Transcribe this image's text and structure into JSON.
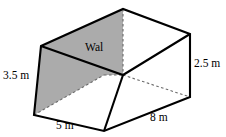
{
  "figure": {
    "type": "3d-cuboid-room-with-interior-wall",
    "caption_labels": {
      "wall_label": "Wal"
    },
    "colors": {
      "wall_fill": "#ababab",
      "wall_top_fill": "#ababab",
      "stroke": "#000000",
      "background": "#ffffff",
      "hidden_edge": "#6b6b6b"
    },
    "dimensions": [
      {
        "id": "height",
        "value": "3.5 m",
        "number": 3.5,
        "unit": "m",
        "edge": "left-vertical-front-left-height"
      },
      {
        "id": "depth",
        "value": "5 m",
        "number": 5,
        "unit": "m",
        "edge": "bottom-front-left-depth"
      },
      {
        "id": "width",
        "value": "8 m",
        "number": 8,
        "unit": "m",
        "edge": "bottom-front-right-width"
      },
      {
        "id": "right_height",
        "value": "2.5 m",
        "number": 2.5,
        "unit": "m",
        "edge": "right-vertical-height"
      }
    ],
    "geometry": {
      "viewbox": "0 0 226 137",
      "vertices": {
        "apex_back_top_left": [
          123,
          9
        ],
        "wall_top_front_left": [
          41,
          46
        ],
        "back_top_right": [
          190,
          34
        ],
        "inner_corner": [
          123,
          75
        ],
        "bottom_far_left": [
          34,
          115
        ],
        "front_bottom_left": [
          104,
          131
        ],
        "bottom_right": [
          190,
          97
        ],
        "hidden_back_bottom": [
          104,
          75
        ]
      },
      "solid_paths": [
        "M41,46 L123,9 L190,34 L190,97 L104,131 L34,115 Z",
        "M41,46 L123,75 L190,34",
        "M123,75 L104,131",
        "M34,115 L41,46"
      ],
      "dashed_paths": [
        "M123,9 L123,75",
        "M123,75 L190,97",
        "M34,115 L104,75",
        "M104,75 L123,75"
      ],
      "shaded_faces": [
        {
          "name": "wall-left-face",
          "path": "M41,46 L123,75 L104,75 L34,115 Z"
        },
        {
          "name": "wall-top-face",
          "path": "M41,46 L123,9 L123,75 Z"
        }
      ]
    }
  }
}
